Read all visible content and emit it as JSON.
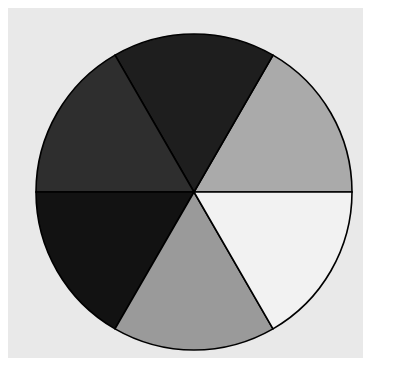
{
  "figure": {
    "background_color": "#ffffff",
    "axes_background_color": "#e9e9e9",
    "width": 395,
    "height": 385,
    "axes_left": 8,
    "axes_top": 8,
    "axes_width": 355,
    "axes_height": 350
  },
  "chart_data": {
    "type": "pie",
    "title": "",
    "subtitle": "",
    "xlabel": "",
    "ylabel": "",
    "labels": [
      "",
      "",
      "",
      "",
      "",
      ""
    ],
    "values": [
      1,
      1,
      1,
      1,
      1,
      1
    ],
    "fractions": [
      0.1667,
      0.1667,
      0.1667,
      0.1667,
      0.1667,
      0.1667
    ],
    "percentages": [
      "16.7%",
      "16.7%",
      "16.7%",
      "16.7%",
      "16.7%",
      "16.7%"
    ],
    "slice_angles_deg": [
      60,
      60,
      60,
      60,
      60,
      60
    ],
    "start_angle_deg": 0,
    "direction": "counterclockwise",
    "colors": [
      "#aaaaaa",
      "#1e1e1e",
      "#2e2e2e",
      "#121212",
      "#9a9a9a",
      "#f2f2f2"
    ],
    "edge_color": "#000000",
    "edge_width": 1.6,
    "legend": false,
    "legend_position": "none",
    "grid": false,
    "annotations": [],
    "autopct": null,
    "center_x": 194,
    "center_y": 192,
    "radius": 158,
    "slices": [
      {
        "index": 0,
        "label": "",
        "value": 1,
        "color": "#aaaaaa",
        "start_deg": 0,
        "end_deg": 60,
        "position": "upper-right"
      },
      {
        "index": 1,
        "label": "",
        "value": 1,
        "color": "#1e1e1e",
        "start_deg": 60,
        "end_deg": 120,
        "position": "top"
      },
      {
        "index": 2,
        "label": "",
        "value": 1,
        "color": "#2e2e2e",
        "start_deg": 120,
        "end_deg": 180,
        "position": "upper-left"
      },
      {
        "index": 3,
        "label": "",
        "value": 1,
        "color": "#121212",
        "start_deg": 180,
        "end_deg": 240,
        "position": "lower-left"
      },
      {
        "index": 4,
        "label": "",
        "value": 1,
        "color": "#9a9a9a",
        "start_deg": 240,
        "end_deg": 300,
        "position": "bottom"
      },
      {
        "index": 5,
        "label": "",
        "value": 1,
        "color": "#f2f2f2",
        "start_deg": 300,
        "end_deg": 360,
        "position": "lower-right"
      }
    ]
  }
}
